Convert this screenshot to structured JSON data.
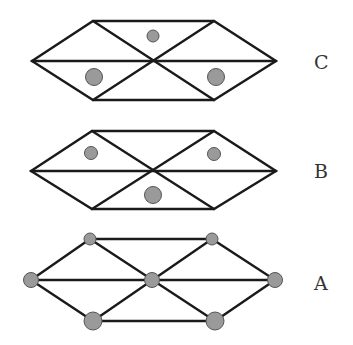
{
  "colors": {
    "edge": "#1a1a1a",
    "dot_fill": "#9a9a9a",
    "dot_stroke": "#555555",
    "background": "#ffffff"
  },
  "panels": [
    {
      "id": "C",
      "label": "C",
      "description": "hexagon of six triangles with three atoms at triangle centers (one top-center small, two lower larger)"
    },
    {
      "id": "B",
      "label": "B",
      "description": "hexagon of six triangles with three atoms at triangle centers (two upper small, one bottom-center larger)"
    },
    {
      "id": "A",
      "label": "A",
      "description": "lattice with seven atoms at vertices: top small, middle medium, bottom large"
    }
  ]
}
